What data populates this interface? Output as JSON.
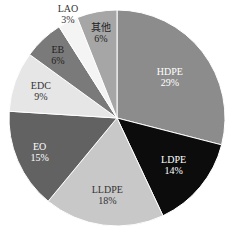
{
  "chart_data": {
    "type": "pie",
    "title": "",
    "start_angle": "top, clockwise",
    "slices": [
      {
        "label": "HDPE",
        "value": 29,
        "pct_text": "29%",
        "color": "#8c8c8c",
        "text_color": "#ffffff"
      },
      {
        "label": "LDPE",
        "value": 14,
        "pct_text": "14%",
        "color": "#0c0c0c",
        "text_color": "#ffffff"
      },
      {
        "label": "LLDPE",
        "value": 18,
        "pct_text": "18%",
        "color": "#c8c8c8",
        "text_color": "#333333"
      },
      {
        "label": "EO",
        "value": 15,
        "pct_text": "15%",
        "color": "#626262",
        "text_color": "#ffffff"
      },
      {
        "label": "EDC",
        "value": 9,
        "pct_text": "9%",
        "color": "#e6e6e6",
        "text_color": "#333333"
      },
      {
        "label": "EB",
        "value": 6,
        "pct_text": "6%",
        "color": "#7a7a7a",
        "text_color": "#222222"
      },
      {
        "label": "LAO",
        "value": 3,
        "pct_text": "3%",
        "color": "#f4f4f4",
        "text_color": "#333333"
      },
      {
        "label": "其他",
        "value": 6,
        "pct_text": "6%",
        "color": "#a6a6a6",
        "text_color": "#222222"
      }
    ]
  }
}
